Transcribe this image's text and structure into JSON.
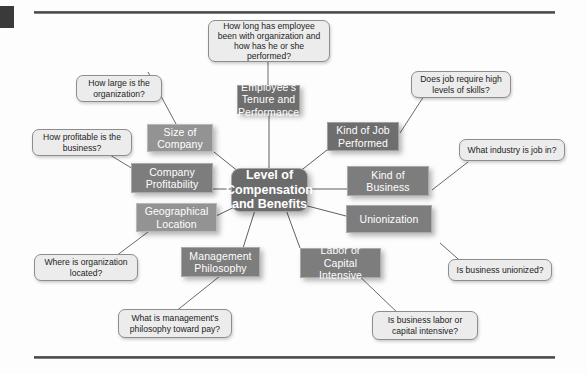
{
  "figure": {
    "hub": {
      "label": "Level of Compensation and Benefits",
      "color": "#6b6b6b"
    },
    "nodes": [
      {
        "id": "employees-tenure",
        "label": "Employee's Tenure and Performance",
        "tone": "dark",
        "color": "#6e6e6e"
      },
      {
        "id": "size-of-company",
        "label": "Size of Company",
        "tone": "light",
        "color": "#939393"
      },
      {
        "id": "kind-of-job",
        "label": "Kind of Job Performed",
        "tone": "dark",
        "color": "#6e6e6e"
      },
      {
        "id": "company-profit",
        "label": "Company Profitability",
        "tone": "medium",
        "color": "#7d7d7d"
      },
      {
        "id": "kind-of-business",
        "label": "Kind of Business",
        "tone": "medium",
        "color": "#7d7d7d"
      },
      {
        "id": "geographical",
        "label": "Geographical Location",
        "tone": "light",
        "color": "#939393"
      },
      {
        "id": "unionization",
        "label": "Unionization",
        "tone": "medium",
        "color": "#7d7d7d"
      },
      {
        "id": "management-phil",
        "label": "Management Philosophy",
        "tone": "medium",
        "color": "#7d7d7d"
      },
      {
        "id": "labor-capital",
        "label": "Labor or Capital Intensive",
        "tone": "medium",
        "color": "#7d7d7d"
      }
    ],
    "callouts": [
      {
        "id": "tenure-question",
        "label": "How long has employee been with organization and how has he or she performed?"
      },
      {
        "id": "size-question",
        "label": "How large is the organization?"
      },
      {
        "id": "skills-question",
        "label": "Does job require high levels of skills?"
      },
      {
        "id": "profitability-question",
        "label": "How profitable is the business?"
      },
      {
        "id": "industry-question",
        "label": "What industry is job in?"
      },
      {
        "id": "location-question",
        "label": "Where is organization located?"
      },
      {
        "id": "unionized-question",
        "label": "Is business unionized?"
      },
      {
        "id": "philosophy-question",
        "label": "What is management's philosophy toward pay?"
      },
      {
        "id": "intensive-question",
        "label": "Is business labor or capital intensive?"
      }
    ]
  }
}
